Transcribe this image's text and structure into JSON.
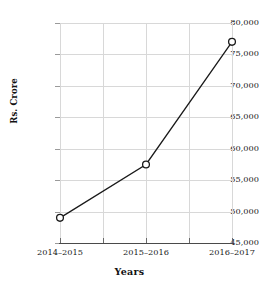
{
  "chart_data": {
    "type": "line",
    "title": "",
    "xlabel": "Years",
    "ylabel": "Rs. Crore",
    "categories": [
      "2014–2015",
      "2015–2016",
      "2016–2017"
    ],
    "values": [
      49000,
      57500,
      77000
    ],
    "series": [
      {
        "name": "Rs. Crore",
        "values": [
          49000,
          57500,
          77000
        ]
      }
    ],
    "ylim": [
      45000,
      80000
    ],
    "ytick_values": [
      45000,
      50000,
      55000,
      60000,
      65000,
      70000,
      75000,
      80000
    ],
    "ytick_labels": [
      "45,000",
      "50,000",
      "55,000",
      "60,000",
      "65,000",
      "70,000",
      "75,000",
      "80,000"
    ],
    "grid": true,
    "legend": "none",
    "marker": "open-circle",
    "line_color": "#1a1a1a",
    "marker_fill": "#ffffff",
    "grid_color": "#d8d8d8",
    "axis_color": "#4a4a4a"
  }
}
